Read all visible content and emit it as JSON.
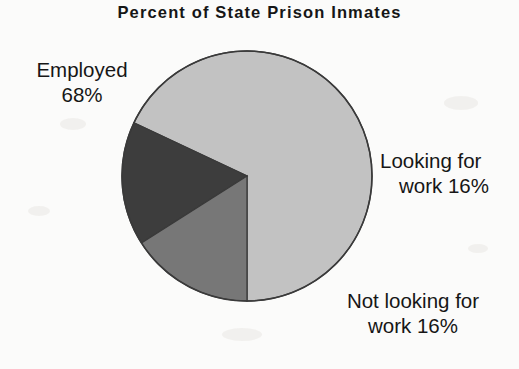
{
  "chart_data": {
    "type": "pie",
    "title": "Percent of State Prison Inmates",
    "categories": [
      "Employed",
      "Looking for work",
      "Not looking for work"
    ],
    "values": [
      68,
      16,
      16
    ],
    "unit": "percent",
    "labels": [
      {
        "name": "employed",
        "line1": "Employed",
        "line2": "68%",
        "value": 68,
        "color": "#c2c2c2",
        "position": "left"
      },
      {
        "name": "looking-for-work",
        "line1": "Looking for",
        "line2": "work 16%",
        "value": 16,
        "color": "#3d3d3d",
        "position": "right"
      },
      {
        "name": "not-looking-for-work",
        "line1": "Not looking for",
        "line2": "work 16%",
        "value": 16,
        "color": "#777777",
        "position": "bottom-right"
      }
    ],
    "start_angle_deg": 180,
    "direction": "counterclockwise",
    "legend": "none",
    "grid": false,
    "colors": {
      "employed": "#c2c2c2",
      "looking_for_work": "#3d3d3d",
      "not_looking_for_work": "#777777",
      "outline": "#3a3a3a",
      "background": "#fbfbfa",
      "text": "#161616"
    }
  }
}
